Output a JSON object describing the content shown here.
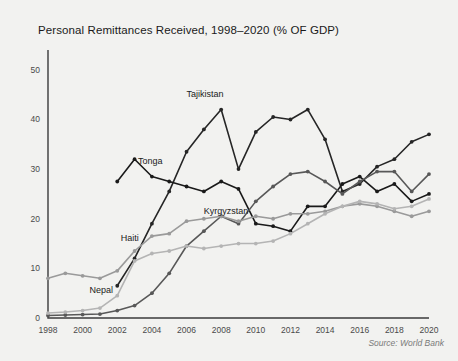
{
  "chart_data": {
    "type": "line",
    "title": "Personal Remittances Received, 1998–2020 (% OF GDP)",
    "xlabel": "",
    "ylabel": "",
    "source": "Source: World Bank",
    "x": [
      1998,
      1999,
      2000,
      2001,
      2002,
      2003,
      2004,
      2005,
      2006,
      2007,
      2008,
      2009,
      2010,
      2011,
      2012,
      2013,
      2014,
      2015,
      2016,
      2017,
      2018,
      2019,
      2020
    ],
    "xtick_labels": [
      "1998",
      "2000",
      "2002",
      "2004",
      "2006",
      "2008",
      "2010",
      "2012",
      "2014",
      "2016",
      "2018",
      "2020"
    ],
    "xtick_values": [
      1998,
      2000,
      2002,
      2004,
      2006,
      2008,
      2010,
      2012,
      2014,
      2016,
      2018,
      2020
    ],
    "ytick_labels": [
      "0",
      "10",
      "20",
      "30",
      "40",
      "50"
    ],
    "ytick_values": [
      0,
      10,
      20,
      30,
      40,
      50
    ],
    "xlim": [
      1998,
      2020
    ],
    "ylim": [
      0,
      54
    ],
    "grid": false,
    "legend_position": "inline-annotations",
    "series": [
      {
        "name": "Tajikistan",
        "color": "#262626",
        "label_x": 2006,
        "label_y": 44.5,
        "values": [
          null,
          null,
          null,
          null,
          6.5,
          12.0,
          19.0,
          25.5,
          33.5,
          38.0,
          42.0,
          30.0,
          37.5,
          40.5,
          40.0,
          42.0,
          36.0,
          25.5,
          27.0,
          30.5,
          32.0,
          35.5,
          37.0
        ]
      },
      {
        "name": "Tonga",
        "color": "#1a1a1a",
        "label_x": 2003.2,
        "label_y": 31.0,
        "values": [
          null,
          null,
          null,
          null,
          27.5,
          32.0,
          28.5,
          27.5,
          26.5,
          25.5,
          27.5,
          26.0,
          19.0,
          18.5,
          17.5,
          22.5,
          22.5,
          27.0,
          28.5,
          25.5,
          27.0,
          23.5,
          25.0
        ]
      },
      {
        "name": "Kyrgyzstan",
        "color": "#585858",
        "label_x": 2007.0,
        "label_y": 21.0,
        "values": [
          0.5,
          0.6,
          0.7,
          0.8,
          1.5,
          2.5,
          5.0,
          9.0,
          14.5,
          17.5,
          20.5,
          19.0,
          23.5,
          26.5,
          29.0,
          29.5,
          27.5,
          25.0,
          27.5,
          29.5,
          29.5,
          25.5,
          29.0
        ]
      },
      {
        "name": "Haiti",
        "color": "#9a9a9a",
        "label_x": 2002.2,
        "label_y": 15.5,
        "values": [
          8.0,
          9.0,
          8.5,
          8.0,
          9.5,
          13.5,
          16.5,
          17.0,
          19.5,
          20.0,
          20.5,
          19.5,
          20.5,
          20.0,
          21.0,
          21.0,
          21.5,
          22.5,
          23.0,
          22.5,
          21.5,
          20.5,
          21.5
        ]
      },
      {
        "name": "Nepal",
        "color": "#b4b4b4",
        "label_x": 2000.4,
        "label_y": 5.0,
        "values": [
          1.0,
          1.2,
          1.5,
          2.0,
          4.5,
          11.5,
          13.0,
          13.5,
          14.5,
          14.0,
          14.5,
          15.0,
          15.0,
          15.5,
          17.0,
          19.0,
          21.0,
          22.5,
          23.5,
          23.0,
          22.0,
          22.5,
          24.0
        ]
      }
    ]
  }
}
